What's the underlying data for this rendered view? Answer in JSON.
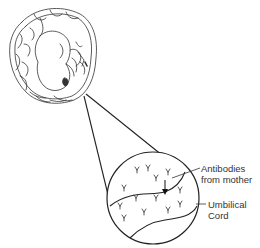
{
  "diagram": {
    "labels": {
      "antibodies_line1": "Antibodies",
      "antibodies_line2": "from mother",
      "cord_line1": "Umbilical",
      "cord_line2": "Cord"
    },
    "colors": {
      "line": "#222222",
      "text": "#333333",
      "antibody": "#444444"
    }
  }
}
